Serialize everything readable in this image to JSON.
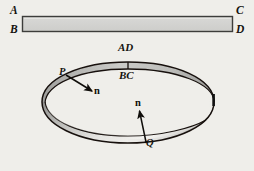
{
  "figure": {
    "background_color": "#efeeea",
    "ink_color": "#15130f",
    "strip": {
      "name": "flat-rectangular-strip",
      "fill_color": "#d2d2d0",
      "border_color": "#3a3a38",
      "x": 22,
      "y": 16,
      "width": 211,
      "height": 16,
      "corner_labels": [
        {
          "id": "A",
          "text": "A",
          "x": 11,
          "y": 6,
          "corner": "top-left"
        },
        {
          "id": "B",
          "text": "B",
          "x": 11,
          "y": 25,
          "corner": "bottom-left"
        },
        {
          "id": "C",
          "text": "C",
          "x": 236,
          "y": 6,
          "corner": "top-right"
        },
        {
          "id": "D",
          "text": "D",
          "x": 236,
          "y": 25,
          "corner": "bottom-right"
        }
      ]
    },
    "band": {
      "name": "mobius-band",
      "center_x": 128,
      "center_y": 102,
      "radius_x": 86,
      "radius_y": 40,
      "band_width": 17,
      "outer_edge_color": "#1a1a18",
      "shade_dark": "#9b9b99",
      "shade_mid": "#c9c9c6",
      "shade_light": "#f2f1ee",
      "seam_labels": [
        {
          "id": "AD",
          "text": "AD",
          "x": 128,
          "y": 42
        },
        {
          "id": "BC",
          "text": "BC",
          "x": 128,
          "y": 70
        }
      ],
      "seam_segment": {
        "x": 128,
        "y_top": 56,
        "y_bottom": 68
      }
    },
    "points": [
      {
        "id": "P",
        "label": "P",
        "label_x": 60,
        "label_y": 68,
        "dot_x": 66,
        "dot_y": 76,
        "normal": {
          "label": "n",
          "from_x": 66,
          "from_y": 75,
          "to_x": 93,
          "to_y": 92,
          "label_x": 97,
          "label_y": 88
        }
      },
      {
        "id": "Q",
        "label": "Q",
        "label_x": 146,
        "label_y": 139,
        "dot_x": 145,
        "dot_y": 142,
        "normal": {
          "label": "n",
          "from_x": 145,
          "from_y": 142,
          "to_x": 139,
          "to_y": 110,
          "label_x": 137,
          "label_y": 99
        }
      }
    ]
  }
}
